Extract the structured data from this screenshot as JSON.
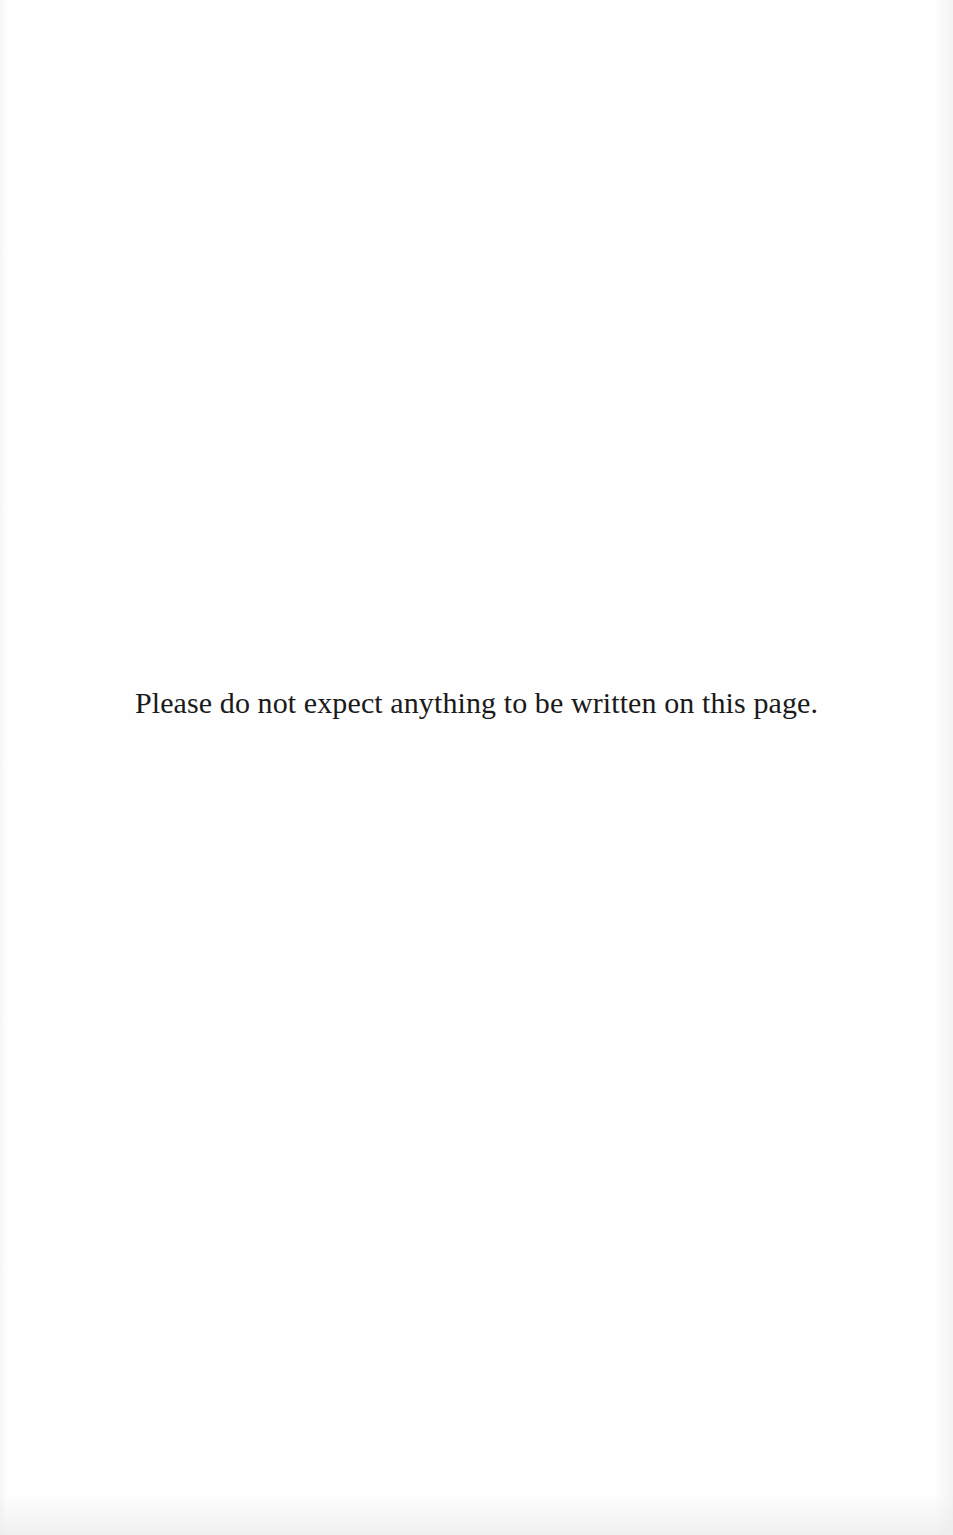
{
  "page": {
    "notice_text": "Please do not expect anything to be written on this page."
  }
}
